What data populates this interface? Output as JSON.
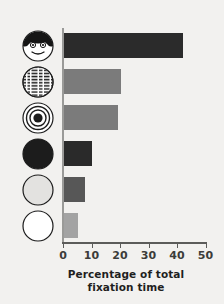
{
  "figure": {
    "background_color": "#f2f1ef",
    "page_color": "#ffffff",
    "axis_color": "#5c5c5a"
  },
  "chart_data": {
    "type": "bar",
    "orientation": "horizontal",
    "title": "",
    "xlabel_line1": "Percentage of total",
    "xlabel_line2": "fixation time",
    "ylabel": "",
    "xlim": [
      0,
      50
    ],
    "xticks": [
      0,
      10,
      20,
      30,
      40,
      50
    ],
    "xtick_labels": [
      "0",
      "10",
      "20",
      "30",
      "40",
      "50"
    ],
    "grid": false,
    "legend": "none",
    "categories": [
      "face",
      "printed-text",
      "bullseye",
      "solid-black-disc",
      "solid-gray-disc",
      "solid-white-disc"
    ],
    "category_labels": [
      "Schematic face",
      "Printed matter",
      "Bull's-eye",
      "Plain black disc",
      "Plain gray disc",
      "Plain white disc"
    ],
    "values": [
      42,
      20,
      19,
      10,
      7.7,
      5
    ],
    "bar_colors": [
      "#2b2b2b",
      "#7b7b7b",
      "#7b7b7b",
      "#2a2a2a",
      "#575757",
      "#a3a3a3"
    ]
  },
  "icons": [
    {
      "name": "face-icon",
      "alt": "schematic face with eyes and smile"
    },
    {
      "name": "printed-text-icon",
      "alt": "circle filled with rows of printed text"
    },
    {
      "name": "bullseye-icon",
      "alt": "concentric rings bullseye"
    },
    {
      "name": "black-disc-icon",
      "alt": "solid black circle"
    },
    {
      "name": "gray-disc-icon",
      "alt": "solid gray circle"
    },
    {
      "name": "white-disc-icon",
      "alt": "solid white circle"
    }
  ]
}
